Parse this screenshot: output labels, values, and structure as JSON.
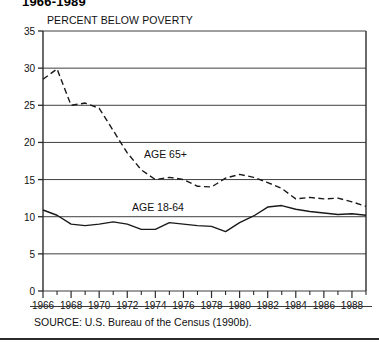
{
  "figure": {
    "title": "1966-1989",
    "source_note": "SOURCE: U.S. Bureau of the Census (1990b).",
    "annotations": {
      "elderly": "AGE 65+",
      "working_age": "AGE 18-64"
    }
  },
  "chart_data": {
    "type": "line",
    "title": "1966-1989",
    "subtitle": "PERCENT BELOW POVERTY",
    "xlabel": "",
    "ylabel": "PERCENT BELOW POVERTY",
    "xlim": [
      1966,
      1989
    ],
    "ylim": [
      0,
      35
    ],
    "grid": true,
    "grid_axis": "y",
    "legend_position": "inline-annotations",
    "y_ticks": [
      0,
      5,
      10,
      15,
      20,
      25,
      30,
      35
    ],
    "y_tick_labels": [
      "0",
      "5",
      "10",
      "15",
      "20",
      "25",
      "30",
      "35"
    ],
    "x_ticks": [
      1966,
      1968,
      1970,
      1972,
      1974,
      1976,
      1978,
      1980,
      1982,
      1984,
      1986,
      1988
    ],
    "x_tick_labels": [
      "1966",
      "1968",
      "1970",
      "1972",
      "1974",
      "1976",
      "1978",
      "1980",
      "1982",
      "1984",
      "1986",
      "1988"
    ],
    "x_minor_ticks": [
      1967,
      1969,
      1971,
      1973,
      1975,
      1977,
      1979,
      1981,
      1983,
      1985,
      1987,
      1989
    ],
    "x": [
      1966,
      1967,
      1968,
      1969,
      1970,
      1971,
      1972,
      1973,
      1974,
      1975,
      1976,
      1977,
      1978,
      1979,
      1980,
      1981,
      1982,
      1983,
      1984,
      1985,
      1986,
      1987,
      1988,
      1989
    ],
    "series": [
      {
        "name": "AGE 65+",
        "style": "dashed",
        "color": "#1a1a1a",
        "values": [
          28.5,
          29.9,
          25.0,
          25.3,
          24.6,
          21.6,
          18.6,
          16.3,
          15.0,
          15.3,
          15.0,
          14.1,
          14.0,
          15.2,
          15.7,
          15.3,
          14.6,
          13.8,
          12.4,
          12.6,
          12.4,
          12.5,
          12.0,
          11.4
        ]
      },
      {
        "name": "AGE 18-64",
        "style": "solid",
        "color": "#1a1a1a",
        "values": [
          10.9,
          10.2,
          9.0,
          8.8,
          9.0,
          9.3,
          9.0,
          8.3,
          8.3,
          9.2,
          9.0,
          8.8,
          8.7,
          8.0,
          9.2,
          10.1,
          11.3,
          11.5,
          11.0,
          10.7,
          10.5,
          10.3,
          10.4,
          10.2
        ]
      }
    ]
  }
}
